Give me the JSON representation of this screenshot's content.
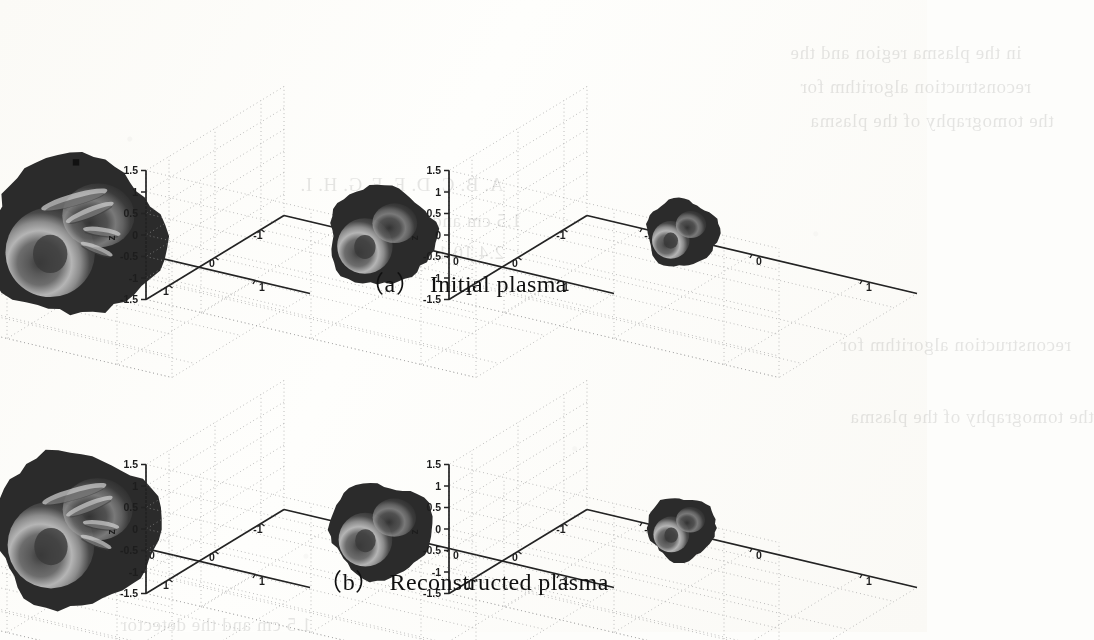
{
  "figure": {
    "kind": "matlab-3d-isosurface-grid",
    "rows": 2,
    "cols": 3,
    "captions": [
      {
        "label": "（a）",
        "text": "Initial plasma"
      },
      {
        "label": "（b）",
        "text": "Reconstructed plasma"
      }
    ]
  },
  "axes": {
    "z_label": "z",
    "z_ticks": [
      "1.5",
      "1",
      "0.5",
      "0",
      "-0.5",
      "-1",
      "-1.5"
    ],
    "z_values": [
      1.5,
      1,
      0.5,
      0,
      -0.5,
      -1,
      -1.5
    ],
    "x_ticks": [
      "1",
      "0",
      "-1"
    ],
    "x_values": [
      1,
      0,
      -1
    ],
    "y_ticks": [
      "1",
      "0",
      "-1"
    ],
    "y_values": [
      1,
      0,
      -1
    ],
    "grid": "dotted",
    "box": "back-walls-and-floor"
  },
  "chart_data": {
    "type": "scatter",
    "title": "",
    "subtitle": "",
    "xlabel": "",
    "ylabel": "",
    "zlabel": "z",
    "xlim": [
      -1.5,
      1.5
    ],
    "ylim": [
      -1.5,
      1.5
    ],
    "zlim": [
      -1.5,
      1.5
    ],
    "grid": true,
    "legend": "none",
    "xticks": [
      1,
      0,
      -1
    ],
    "yticks": [
      1,
      0,
      -1
    ],
    "zticks": [
      1.5,
      1,
      0.5,
      0,
      -0.5,
      -1,
      -1.5
    ],
    "panels": [
      {
        "row": "a",
        "col": 0,
        "caption_group": "Initial plasma",
        "view": "wide",
        "blob_radius_rel": 1.0,
        "center": [
          0.0,
          0.0,
          -0.1
        ],
        "description": "large dark isosurface shell with bright annular ring lower-left and filament streaks upper-right",
        "markers": [
          [
            0.0,
            0.0,
            1.62
          ],
          [
            0.0,
            -1.55,
            -1.5
          ]
        ]
      },
      {
        "row": "a",
        "col": 1,
        "caption_group": "Initial plasma",
        "view": "medium",
        "blob_radius_rel": 0.62,
        "center": [
          0.1,
          0.05,
          0.0
        ],
        "description": "medium isosurface, concentric grey shells, dark core",
        "markers": []
      },
      {
        "row": "a",
        "col": 2,
        "caption_group": "Initial plasma",
        "view": "narrow",
        "blob_radius_rel": 0.42,
        "center": [
          0.15,
          0.05,
          0.1
        ],
        "description": "small compact isosurface with dark core",
        "markers": []
      },
      {
        "row": "b",
        "col": 0,
        "caption_group": "Reconstructed plasma",
        "view": "wide",
        "blob_radius_rel": 0.97,
        "center": [
          0.0,
          0.0,
          -0.08
        ],
        "description": "large dark isosurface shell, bright annular ring lower-left, filaments upper-right",
        "markers": []
      },
      {
        "row": "b",
        "col": 1,
        "caption_group": "Reconstructed plasma",
        "view": "medium",
        "blob_radius_rel": 0.6,
        "center": [
          0.1,
          0.05,
          0.0
        ],
        "description": "medium isosurface with concentric shells",
        "markers": []
      },
      {
        "row": "b",
        "col": 2,
        "caption_group": "Reconstructed plasma",
        "view": "narrow",
        "blob_radius_rel": 0.4,
        "center": [
          0.15,
          0.05,
          0.08
        ],
        "description": "small compact isosurface",
        "markers": []
      }
    ]
  },
  "colors": {
    "page": "#fdfdfb",
    "axis_line": "#232323",
    "grid_line": "#9a9a9a",
    "tick_text": "#1d1d1d",
    "caption_text": "#101010",
    "blob_shell": "#2b2b2b",
    "blob_mid": "#6f6f6f",
    "blob_bright": "#b9b9b9",
    "blob_core": "#3a3a3a",
    "marker": "#111111"
  },
  "bleed_through": {
    "note": "faint mirrored text showing through from reverse of scanned page",
    "lines": [
      "in the plasma region and the",
      "reconstruction algorithm for",
      "the tomography of the plasma",
      "A. B. C. D. E. F. G. H. I.",
      "1.5 cm  and  the  detector",
      "2.4  10  1.0  0.5  0.125"
    ]
  }
}
